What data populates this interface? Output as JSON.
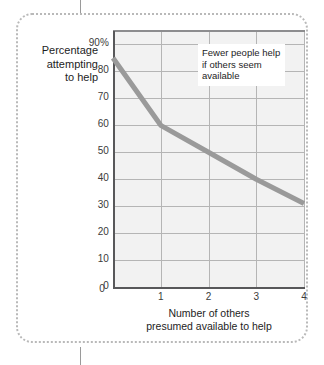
{
  "figure": {
    "frame_style": "dotted-rounded-border",
    "frame_color": "#b9b9b9"
  },
  "colors": {
    "series_line": "#9a9a9a",
    "plot_background": "#f2f2f2",
    "gridline": "#b5b5b5",
    "axis": "#58585a",
    "text": "#1d1d1d"
  },
  "chart_data": {
    "type": "line",
    "title": "",
    "subtitle": "",
    "xlabel": "Number of others presumed available to help",
    "ylabel": "Percentage attempting to help",
    "ylabel_lines": [
      "Percentage",
      "attempting",
      "to help"
    ],
    "xlabel_lines": [
      "Number of others",
      "presumed available to help"
    ],
    "x": [
      0,
      1,
      2,
      3,
      4
    ],
    "values": [
      85,
      60,
      50,
      40,
      31
    ],
    "series": [
      {
        "name": "Percentage attempting to help",
        "values": [
          85,
          60,
          50,
          40,
          31
        ]
      }
    ],
    "xlim": [
      0,
      4
    ],
    "ylim": [
      0,
      95
    ],
    "xticks": [
      "0",
      "1",
      "2",
      "3",
      "4"
    ],
    "xtick_values": [
      0,
      1,
      2,
      3,
      4
    ],
    "yticks": [
      "0",
      "10",
      "20",
      "30",
      "40",
      "50",
      "60",
      "70",
      "80",
      "90%"
    ],
    "ytick_values": [
      0,
      10,
      20,
      30,
      40,
      50,
      60,
      70,
      80,
      90
    ],
    "grid": true,
    "legend": false,
    "legend_position": "none",
    "annotations": [
      {
        "id": "callout",
        "lines": [
          "Fewer people help",
          "if others seem",
          "available"
        ],
        "text": "Fewer people help if others seem available"
      }
    ]
  }
}
